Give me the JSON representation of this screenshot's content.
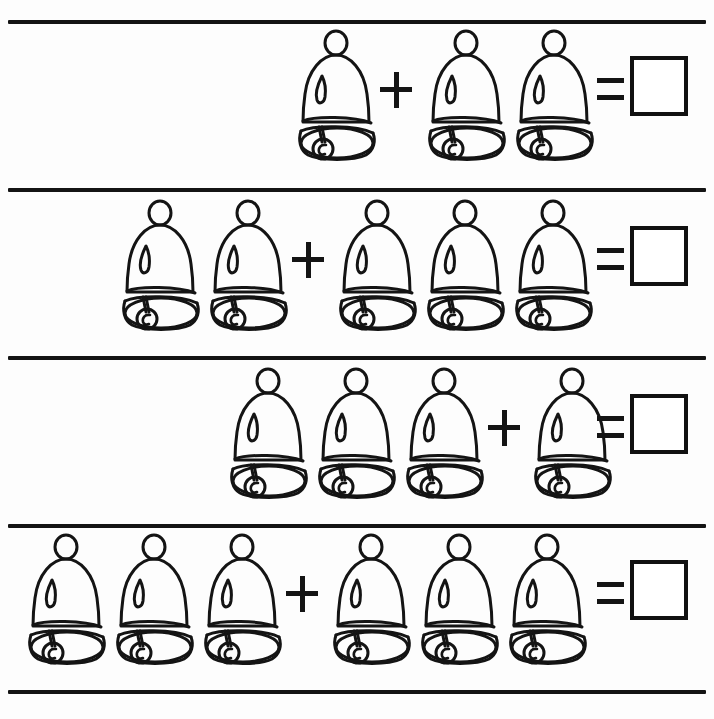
{
  "worksheet": {
    "title": "Bell Addition Worksheet",
    "background_color": "#fdfdfd",
    "ink_color": "#141414",
    "width": 714,
    "height": 719,
    "object_name": "bell",
    "operator_plus": "+",
    "operator_equals": "=",
    "answer_value": ""
  },
  "rule_lines": [
    {
      "name": "rule-line-top",
      "x": 8,
      "y": 20,
      "width": 698,
      "thickness": 4
    },
    {
      "name": "rule-line-1",
      "x": 8,
      "y": 188,
      "width": 698,
      "thickness": 4
    },
    {
      "name": "rule-line-2",
      "x": 8,
      "y": 356,
      "width": 698,
      "thickness": 4
    },
    {
      "name": "rule-line-3",
      "x": 8,
      "y": 524,
      "width": 698,
      "thickness": 4
    },
    {
      "name": "rule-line-bottom",
      "x": 8,
      "y": 690,
      "width": 698,
      "thickness": 4
    }
  ],
  "rows": [
    {
      "index": 1,
      "left_count": 1,
      "right_count": 2,
      "answer": "",
      "top": 30,
      "start_x": 292,
      "plus_x": 380,
      "group2_x": 422,
      "equals_x": 597,
      "box_x": 630
    },
    {
      "index": 2,
      "left_count": 2,
      "right_count": 3,
      "answer": "",
      "top": 200,
      "start_x": 116,
      "plus_x": 292,
      "group2_x": 333,
      "equals_x": 597,
      "box_x": 630
    },
    {
      "index": 3,
      "left_count": 3,
      "right_count": 1,
      "answer": "",
      "top": 368,
      "start_x": 224,
      "plus_x": 488,
      "group2_x": 528,
      "equals_x": 597,
      "box_x": 630
    },
    {
      "index": 4,
      "left_count": 3,
      "right_count": 3,
      "answer": "",
      "top": 534,
      "start_x": 22,
      "plus_x": 286,
      "group2_x": 327,
      "equals_x": 597,
      "box_x": 630
    }
  ],
  "bell_glyph": {
    "name": "bell-icon",
    "parts": [
      "handle-ring",
      "dome",
      "highlight-teardrop",
      "band",
      "skirt",
      "clapper-stem",
      "clapper-ball"
    ]
  }
}
